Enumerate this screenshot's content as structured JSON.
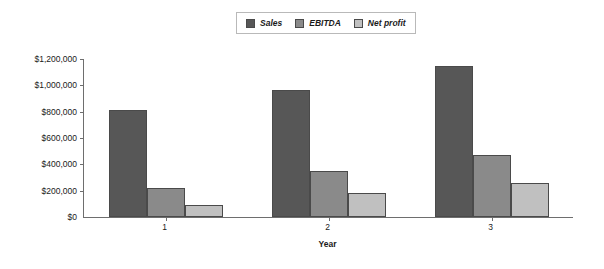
{
  "chart_data": {
    "type": "bar",
    "title": "",
    "xlabel": "Year",
    "ylabel": "",
    "categories": [
      "1",
      "2",
      "3"
    ],
    "series": [
      {
        "name": "Sales",
        "color": "#575757",
        "values": [
          812000,
          967000,
          1147000
        ]
      },
      {
        "name": "EBITDA",
        "color": "#8a8a8a",
        "values": [
          222000,
          348000,
          470000
        ]
      },
      {
        "name": "Net profit",
        "color": "#c0c0c0",
        "values": [
          88000,
          180000,
          260000
        ]
      }
    ],
    "ylim": [
      0,
      1200000
    ],
    "ytick_values": [
      0,
      200000,
      400000,
      600000,
      800000,
      1000000,
      1200000
    ],
    "ytick_labels": [
      "$0",
      "$200,000",
      "$400,000",
      "$600,000",
      "$800,000",
      "$1,000,000",
      "$1,200,000"
    ],
    "grid": false,
    "legend_position": "top-center"
  },
  "legend": {
    "entries": [
      {
        "label": "Sales"
      },
      {
        "label": "EBITDA"
      },
      {
        "label": "Net profit"
      }
    ]
  },
  "axis": {
    "x_title": "Year"
  }
}
